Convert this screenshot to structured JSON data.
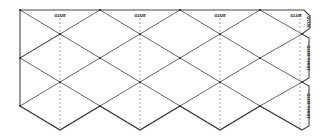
{
  "diagram": {
    "type": "paper-net-template",
    "colors": {
      "background": "#ffffff",
      "lines": "#555555",
      "fold_lines": "#777777",
      "vertices": "#222222"
    },
    "top_labels": [
      {
        "text": "GLUE",
        "x": 60,
        "y": 17
      },
      {
        "text": "GLUE",
        "x": 140,
        "y": 17
      },
      {
        "text": "GLUE",
        "x": 220,
        "y": 17
      },
      {
        "text": "GLUE",
        "x": 298,
        "y": 17
      }
    ],
    "corner_tab_label": "GLUE",
    "side_tabs": [
      {
        "text": "GLUE FIRST",
        "y_top": 36,
        "y_bottom": 80
      },
      {
        "text": "GLUE FIRST",
        "y_top": 84,
        "y_bottom": 128
      }
    ]
  }
}
